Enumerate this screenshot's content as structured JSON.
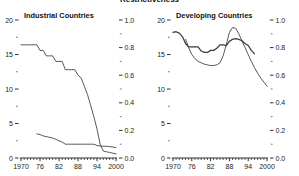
{
  "title": "Restrictiveness",
  "panels": [
    {
      "name": "industrial",
      "title": "Industrial Countries",
      "left_axis": {
        "ticks": [
          "0",
          "5",
          "10",
          "15",
          "20"
        ],
        "values": [
          0,
          5,
          10,
          15,
          20
        ],
        "minor": [
          2.5,
          7.5,
          12.5,
          17.5
        ]
      },
      "right_axis": {
        "ticks": [
          "0.0",
          "0.2",
          "0.4",
          "0.6",
          "0.8",
          "1.0"
        ],
        "values": [
          0,
          0.2,
          0.4,
          0.6,
          0.8,
          1.0
        ],
        "minor": [
          0.1,
          0.3,
          0.5,
          0.7,
          0.9
        ]
      },
      "x_axis": {
        "ticks": [
          "1970",
          "76",
          "82",
          "88",
          "94",
          "2000"
        ],
        "values": [
          1970,
          1976,
          1982,
          1988,
          1994,
          2000
        ],
        "range": [
          1970,
          2000
        ]
      }
    },
    {
      "name": "developing",
      "title": "Developing Countries",
      "left_axis": {
        "ticks": [
          "0",
          "5",
          "10",
          "15",
          "20"
        ],
        "values": [
          0,
          5,
          10,
          15,
          20
        ],
        "minor": [
          2.5,
          7.5,
          12.5,
          17.5
        ]
      },
      "right_axis": {
        "ticks": [
          "0.0",
          "0.2",
          "0.4",
          "0.6",
          "0.8",
          "1.0"
        ],
        "values": [
          0,
          0.2,
          0.4,
          0.6,
          0.8,
          1.0
        ],
        "minor": [
          0.1,
          0.3,
          0.5,
          0.7,
          0.9
        ]
      },
      "x_axis": {
        "ticks": [
          "1970",
          "76",
          "82",
          "88",
          "94",
          "2000"
        ],
        "values": [
          1970,
          1976,
          1982,
          1988,
          1994,
          2000
        ],
        "range": [
          1970,
          2000
        ]
      }
    }
  ],
  "chart_data": [
    {
      "type": "line",
      "title": "Industrial Countries",
      "xlabel": "",
      "ylabel": "",
      "xlim": [
        1970,
        2000
      ],
      "ylim_left": [
        0,
        20
      ],
      "ylim_right": [
        0.0,
        1.0
      ],
      "grid": false,
      "legend": "none",
      "x": [
        1970,
        1971,
        1972,
        1973,
        1974,
        1975,
        1976,
        1977,
        1978,
        1979,
        1980,
        1981,
        1982,
        1983,
        1984,
        1985,
        1986,
        1987,
        1988,
        1989,
        1990,
        1991,
        1992,
        1993,
        1994,
        1995,
        1996,
        1997,
        1998,
        1999,
        2000
      ],
      "series": [
        {
          "name": "Restrictiveness index",
          "axis": "right",
          "values": [
            0.82,
            0.82,
            0.82,
            0.82,
            0.82,
            0.82,
            0.78,
            0.78,
            0.74,
            0.74,
            0.74,
            0.7,
            0.7,
            0.7,
            0.64,
            0.64,
            0.64,
            0.64,
            0.6,
            0.58,
            0.52,
            0.46,
            0.38,
            0.3,
            0.21,
            0.1,
            0.05,
            0.045,
            0.04,
            0.035,
            0.03
          ]
        },
        {
          "name": "Number of countries",
          "axis": "left",
          "values": [
            null,
            null,
            null,
            null,
            null,
            3.5,
            3.4,
            3.2,
            3.1,
            3.0,
            2.9,
            2.7,
            2.5,
            2.3,
            2.0,
            2.0,
            2.0,
            2.0,
            2.0,
            2.0,
            2.0,
            2.0,
            2.0,
            2.0,
            1.8,
            1.75,
            1.7,
            1.7,
            1.65,
            1.6,
            1.5
          ]
        }
      ]
    },
    {
      "type": "line",
      "title": "Developing Countries",
      "xlabel": "",
      "ylabel": "",
      "xlim": [
        1970,
        2000
      ],
      "ylim_left": [
        0,
        20
      ],
      "ylim_right": [
        0.0,
        1.0
      ],
      "grid": false,
      "legend": "none",
      "x": [
        1970,
        1971,
        1972,
        1973,
        1974,
        1975,
        1976,
        1977,
        1978,
        1979,
        1980,
        1981,
        1982,
        1983,
        1984,
        1985,
        1986,
        1987,
        1988,
        1989,
        1990,
        1991,
        1992,
        1993,
        1994,
        1995,
        1996,
        1997,
        1998,
        1999,
        2000
      ],
      "series": [
        {
          "name": "Number of countries",
          "axis": "left",
          "values": [
            18.2,
            18.3,
            18.1,
            17.6,
            16.6,
            16.1,
            16.1,
            16.1,
            16.1,
            15.5,
            15.3,
            15.3,
            15.6,
            15.6,
            15.9,
            16.4,
            16.4,
            16.3,
            16.9,
            17.2,
            17.3,
            17.2,
            17.0,
            16.6,
            16.3,
            15.6,
            15.1,
            null,
            null,
            null,
            null
          ]
        },
        {
          "name": "Restrictiveness index",
          "axis": "right",
          "values": [
            null,
            null,
            null,
            null,
            0.86,
            0.8,
            0.75,
            0.72,
            0.7,
            0.69,
            0.68,
            0.675,
            0.67,
            0.67,
            0.675,
            0.69,
            0.74,
            0.82,
            0.91,
            0.945,
            0.94,
            0.9,
            0.85,
            0.8,
            0.75,
            0.7,
            0.655,
            0.615,
            0.58,
            0.55,
            0.52
          ]
        }
      ]
    }
  ]
}
